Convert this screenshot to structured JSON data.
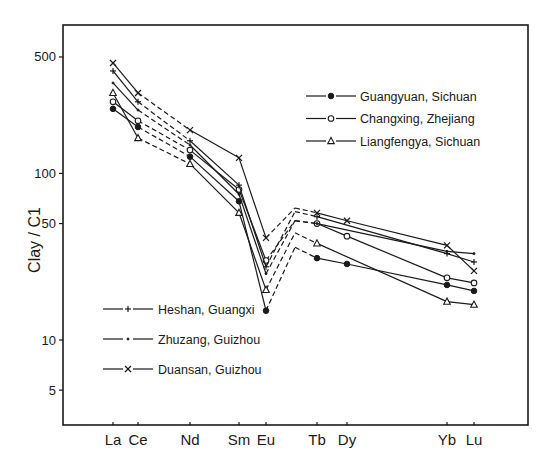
{
  "chart_data": {
    "type": "line",
    "title": "",
    "xlabel": "",
    "ylabel": "Clay / C1",
    "yscale": "log",
    "ylim": [
      3.1,
      780
    ],
    "yticks": [
      5,
      10,
      50,
      100,
      500
    ],
    "ytick_labels": [
      "5",
      "10",
      "50",
      "100",
      "500"
    ],
    "grid": false,
    "categories": [
      "La",
      "Ce",
      "Nd",
      "Sm",
      "Eu",
      "Gd",
      "Tb",
      "Dy",
      "Yb",
      "Lu"
    ],
    "x_labels_shown": [
      "La",
      "Ce",
      "Nd",
      "Sm",
      "Eu",
      "Tb",
      "Dy",
      "Yb",
      "Lu"
    ],
    "x_units": {
      "La": 57,
      "Ce": 58,
      "Nd": 60,
      "Sm": 62,
      "Eu": 63,
      "Gd": 64,
      "Tb": 65,
      "Dy": 66,
      "Yb": 70,
      "Lu": 71
    },
    "series": [
      {
        "name": "Guangyuan, Sichuan",
        "marker": "filled-circle",
        "line_style": "solid",
        "values": {
          "La": 244,
          "Ce": 190,
          "Nd": 126,
          "Sm": 68,
          "Eu": 15,
          "Gd": 36,
          "Tb": 31,
          "Dy": 28.6,
          "Yb": 21.4,
          "Lu": 19.7
        }
      },
      {
        "name": "Changxing, Zhejiang",
        "marker": "open-circle",
        "line_style": "solid",
        "values": {
          "La": 269,
          "Ce": 207,
          "Nd": 138,
          "Sm": 80,
          "Eu": 30,
          "Gd": 52,
          "Tb": 50,
          "Dy": 42,
          "Yb": 23.6,
          "Lu": 22
        }
      },
      {
        "name": "Liangfengya, Sichuan",
        "marker": "triangle",
        "line_style": "solid",
        "values": {
          "La": 304,
          "Ce": 163,
          "Nd": 114,
          "Sm": 58,
          "Eu": 20,
          "Gd": 44,
          "Tb": 38,
          "Dy": null,
          "Yb": 17,
          "Lu": 16.3
        }
      },
      {
        "name": "Heshan, Guangxi",
        "marker": "plus",
        "line_style": "solid",
        "values": {
          "La": 412,
          "Ce": 269,
          "Nd": 157,
          "Sm": 85,
          "Eu": 27.5,
          "Gd": 59,
          "Tb": 55,
          "Dy": null,
          "Yb": 33,
          "Lu": 29.4
        }
      },
      {
        "name": "Zhuzang, Guizhou",
        "marker": "dot",
        "line_style": "solid",
        "values": {
          "La": 349,
          "Ce": 240,
          "Nd": 148,
          "Sm": 75,
          "Eu": 25,
          "Gd": 52,
          "Tb": 50,
          "Dy": null,
          "Yb": 34,
          "Lu": 33
        }
      },
      {
        "name": "Duansan, Guizhou",
        "marker": "cross",
        "line_style": "solid",
        "values": {
          "La": 460,
          "Ce": 304,
          "Nd": 182,
          "Sm": 124,
          "Eu": 41,
          "Gd": 62,
          "Tb": 58,
          "Dy": 52,
          "Yb": 37,
          "Lu": 26
        }
      }
    ],
    "interpolated_segments_dashed": [
      "Ce-Nd",
      "Eu-Gd",
      "Gd-Tb"
    ],
    "legends": [
      {
        "placement": "top-right",
        "entries": [
          "Guangyuan, Sichuan",
          "Changxing, Zhejiang",
          "Liangfengya, Sichuan"
        ]
      },
      {
        "placement": "bottom-left",
        "entries": [
          "Heshan, Guangxi",
          "Zhuzang, Guizhou",
          "Duansan, Guizhou"
        ]
      }
    ]
  }
}
